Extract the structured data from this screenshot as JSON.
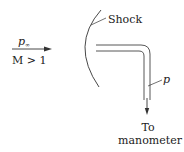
{
  "diagram": {
    "flow": {
      "pressure_label": "p",
      "pressure_subscript": "∞",
      "mach_label": "M > 1"
    },
    "shock_label": "Shock",
    "probe_pressure_label": "p",
    "outlet_label_line1": "To",
    "outlet_label_line2": "manometer",
    "colors": {
      "line": "#333333",
      "text": "#222222",
      "background": "#ffffff"
    }
  }
}
